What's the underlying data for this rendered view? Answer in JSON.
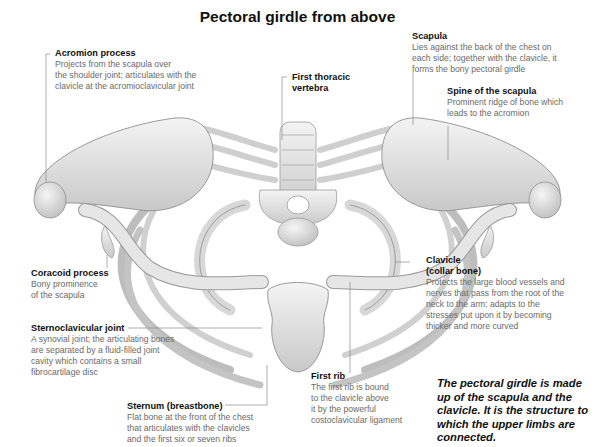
{
  "title": "Pectoral girdle from above",
  "labels": {
    "acromion": {
      "heading": "Acromion process",
      "lines": [
        "Projects from the scapula over",
        "the shoulder joint; articulates with the",
        "clavicle at the acromioclavicular joint"
      ]
    },
    "first_thoracic": {
      "heading_lines": [
        "First thoracic",
        "vertebra"
      ]
    },
    "scapula": {
      "heading": "Scapula",
      "lines": [
        "Lies against the back of the chest on",
        "each side; together with the clavicle, it",
        "forms the bony pectoral girdle"
      ]
    },
    "spine_scapula": {
      "heading": "Spine of the scapula",
      "lines": [
        "Prominent ridge of bone which",
        "leads to the acromion"
      ]
    },
    "coracoid": {
      "heading": "Coracoid process",
      "lines": [
        "Bony prominence",
        "of the scapula"
      ]
    },
    "clavicle": {
      "heading_lines": [
        "Clavicle",
        "(collar bone)"
      ],
      "lines": [
        "Protects the large blood vessels and",
        "nerves that pass from the root of the",
        "neck to the arm; adapts to the",
        "stresses put upon it by becoming",
        "thicker and more curved"
      ]
    },
    "sternoclavicular": {
      "heading": "Sternoclavicular joint",
      "lines": [
        "A synovial joint; the articulating bones",
        "are separated by a fluid-filled joint",
        "cavity which contains a small",
        "fibrocartilage disc"
      ]
    },
    "first_rib": {
      "heading": "First rib",
      "lines": [
        "The first rib is bound",
        "to the clavicle above",
        "it by the powerful",
        "costoclavicular ligament"
      ]
    },
    "sternum": {
      "heading": "Sternum (breastbone)",
      "lines": [
        "Flat bone at the front of the chest",
        "that articulates with the clavicles",
        "and the first six or seven ribs"
      ]
    }
  },
  "summary": "The pectoral girdle is made up of the scapula and the clavicle. It is the structure to which the upper limbs are connected."
}
